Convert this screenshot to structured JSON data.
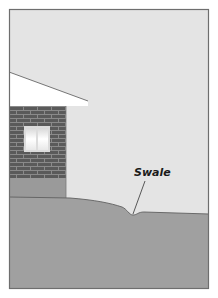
{
  "diagram": {
    "labels": {
      "swale": "Swale"
    },
    "elements": {
      "sky": "sky-background",
      "roof": "roof-overhang",
      "wall": "brick-wall",
      "window": "window",
      "foundation": "foundation",
      "ground": "ground",
      "swale_dip": "swale-depression"
    },
    "colors": {
      "sky": "#e4e4e4",
      "ground": "#a0a0a0",
      "roof": "#ffffff",
      "brick": "#5a5a5a",
      "mortar": "#8a8a8a",
      "foundation": "#9a9a9a",
      "window_glass": "#f4f4f4",
      "frame_border": "#6e6e6e",
      "line": "#444444"
    }
  }
}
